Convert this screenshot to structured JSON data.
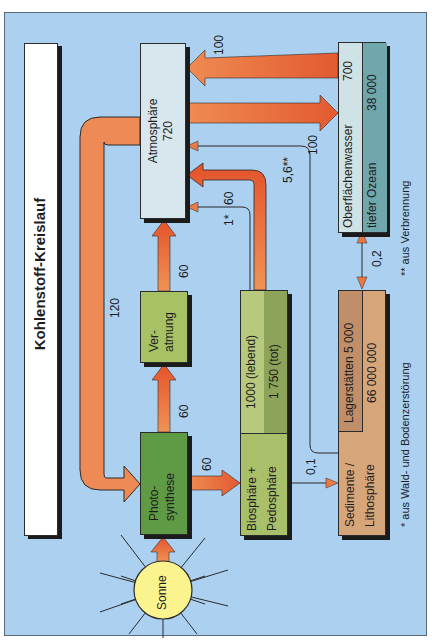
{
  "title": "Kohlenstoff-Kreislauf",
  "colors": {
    "background": "#abd0f0",
    "arrow": "#ea7a45",
    "arrow_dark": "#e2552d",
    "atmosphere": "#d8e7ee",
    "surface_water": "#cfe3e6",
    "deep_ocean": "#6fa7ac",
    "photosynthesis": "#5f9a45",
    "respiration": "#a7c265",
    "biosphere": "#a9bf6a",
    "biosphere_dead": "#8da35a",
    "sediment": "#d7a57a",
    "deposits": "#c08e68",
    "sun": "#fbf48e"
  },
  "nodes": {
    "sun": {
      "label": "Sonne"
    },
    "photosynthesis": {
      "line1": "Photo-",
      "line2": "synthese"
    },
    "respiration": {
      "line1": "Ver-",
      "line2": "atmung"
    },
    "atmosphere": {
      "label": "Atmosphäre",
      "value": "720"
    },
    "ocean": {
      "surface_label": "Oberflächenwasser",
      "surface_value": "700",
      "deep_label": "tiefer Ozean",
      "deep_value": "38 000"
    },
    "biosphere": {
      "line1": "Biosphäre +",
      "line2": "Pedosphäre",
      "living": "1000 (lebend)",
      "dead": "1 750 (tot)"
    },
    "sediment": {
      "line1": "Sedimente /",
      "line2": "Lithosphäre",
      "deposits": "Lagerstätten 5 000",
      "value": "66 000 000"
    }
  },
  "flows": {
    "atm_to_photo": "120",
    "photo_to_resp": "60",
    "resp_to_atm": "60",
    "photo_to_bio": "60",
    "bio_to_atm": "60",
    "bio_to_atm_star": "1*",
    "sed_to_atm": "5,6**",
    "atm_to_ocean": "100",
    "ocean_to_atm": "100",
    "bio_to_sed": "0,1",
    "ocean_sed": "0,2"
  },
  "footnotes": {
    "star": "* aus Wald- und Bodenzerstörung",
    "double_star": "** aus Verbrennung"
  }
}
